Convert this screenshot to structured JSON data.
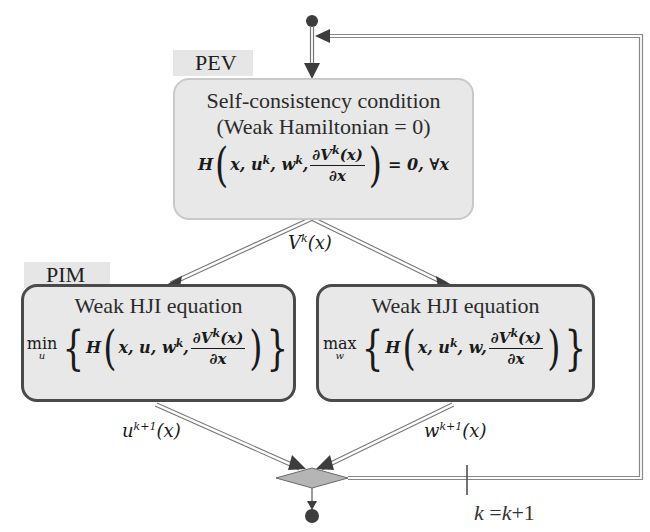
{
  "diagram": {
    "type": "flowchart",
    "pev": {
      "tag": "PEV",
      "title_line1": "Self-consistency condition",
      "title_line2": "(Weak Hamiltonian = 0)",
      "equation": "H(x, u^k, w^k, ∂V^k(x)/∂x) = 0, ∀x",
      "eq_H": "H",
      "eq_args": "x, u",
      "eq_sup_k": "k",
      "eq_w": ", w",
      "eq_num": "∂V",
      "eq_num_tail": "(x)",
      "eq_den": "∂x",
      "eq_rhs": "= 0, ∀x"
    },
    "edge_pev_to_pim": {
      "label": "V^k(x)",
      "base": "V",
      "sup": "k",
      "tail": "(x)"
    },
    "pim": {
      "tag": "PIM",
      "left": {
        "title": "Weak HJI equation",
        "operator": "min",
        "operator_sub": "u",
        "equation": "min_u { H(x, u, w^k, ∂V^k(x)/∂x) }",
        "args_a": "x, u, w",
        "sup_k": "k"
      },
      "right": {
        "title": "Weak HJI equation",
        "operator": "max",
        "operator_sub": "w",
        "equation": "max_w { H(x, u^k, w, ∂V^k(x)/∂x) }",
        "args_a": "x, u",
        "sup_k": "k",
        "args_b": ", w"
      }
    },
    "edge_left_out": {
      "label": "u^{k+1}(x)",
      "base": "u",
      "sup": "k+1",
      "tail": "(x)"
    },
    "edge_right_out": {
      "label": "w^{k+1}(x)",
      "base": "w",
      "sup": "k+1",
      "tail": "(x)"
    },
    "loop_update": {
      "label": "k =k+1",
      "k": "k",
      "rest": " =",
      "k2": "k",
      "plus": "+1"
    },
    "nodes": [
      "start-node",
      "merge-diamond",
      "end-node"
    ],
    "colors": {
      "box_fill": "#e8e8e8",
      "pev_border": "#c9c9c9",
      "pim_border": "#4a4a4a",
      "tag_fill": "#e6e6e6",
      "arrow": "#555555",
      "diamond_fill": "#b5b5b5"
    }
  }
}
